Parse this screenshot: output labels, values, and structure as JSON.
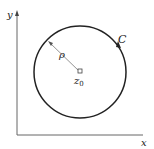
{
  "diagram": {
    "axes": {
      "x_label": "x",
      "y_label": "y"
    },
    "curve_label": "C",
    "radius_label": "ρ",
    "center_label": "z",
    "center_subscript": "0",
    "colors": {
      "stroke": "#222222",
      "radius_line": "#777777"
    }
  }
}
